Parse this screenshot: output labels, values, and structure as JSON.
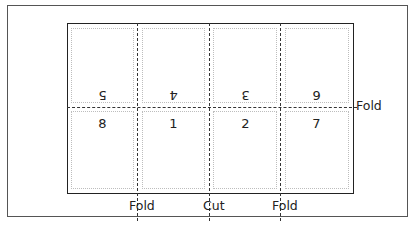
{
  "diagram": {
    "top_row_pages": [
      "5",
      "4",
      "3",
      "6"
    ],
    "bottom_row_pages": [
      "8",
      "1",
      "2",
      "7"
    ],
    "labels": {
      "fold_right": "Fold",
      "fold_left_bottom": "Fold",
      "cut_bottom": "Cut",
      "fold_right_bottom": "Fold"
    },
    "colors": {
      "frame": "#555555",
      "sheet": "#222222",
      "dashed_line": "#333333",
      "margin_dotted": "#bdbdbd"
    }
  }
}
